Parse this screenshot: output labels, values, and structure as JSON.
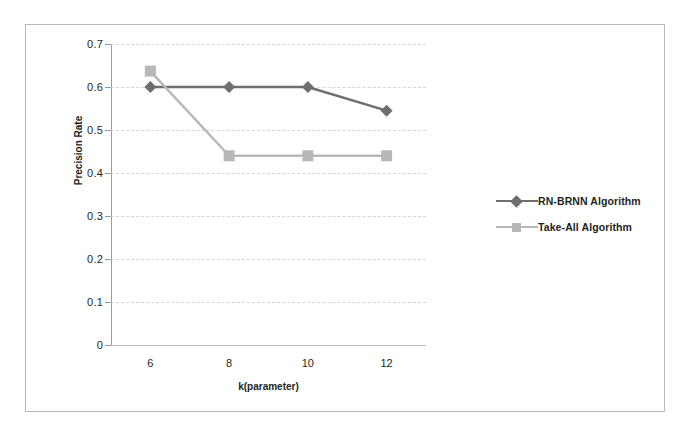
{
  "figure": {
    "background_color": "#ffffff",
    "frame_color": "#b9b9b9"
  },
  "chart_data": {
    "type": "line",
    "title": "",
    "xlabel": "k(parameter)",
    "ylabel": "Precision Rate",
    "categories": [
      "6",
      "8",
      "10",
      "12"
    ],
    "x": [
      6,
      8,
      10,
      12
    ],
    "xlim": [
      5,
      13
    ],
    "ylim": [
      0,
      0.7
    ],
    "yticks": [
      "0",
      "0.1",
      "0.2",
      "0.3",
      "0.4",
      "0.5",
      "0.6",
      "0.7"
    ],
    "ytick_values": [
      0,
      0.1,
      0.2,
      0.3,
      0.4,
      0.5,
      0.6,
      0.7
    ],
    "grid": true,
    "grid_style": "dashed-horizontal",
    "legend_position": "right",
    "series": [
      {
        "name": "RN-BRNN Algorithm",
        "values": [
          0.6,
          0.6,
          0.6,
          0.545
        ],
        "color": "#6e6e6e",
        "marker": "diamond"
      },
      {
        "name": "Take-All Algorithm",
        "values": [
          0.637,
          0.44,
          0.44,
          0.44
        ],
        "color": "#b8b8b8",
        "marker": "square"
      }
    ]
  },
  "legend": {
    "items": [
      {
        "label": "RN-BRNN Algorithm",
        "color": "#6e6e6e",
        "marker": "diamond"
      },
      {
        "label": "Take-All Algorithm",
        "color": "#b8b8b8",
        "marker": "square"
      }
    ]
  }
}
